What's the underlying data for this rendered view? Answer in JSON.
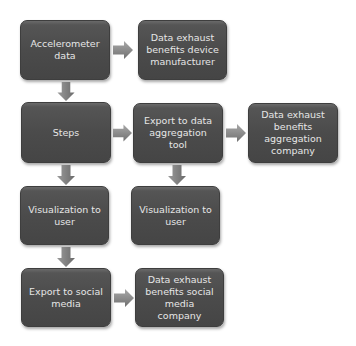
{
  "diagram": {
    "type": "flowchart",
    "nodes": [
      {
        "id": "accelerometer",
        "label": "Accelerometer data"
      },
      {
        "id": "exhaust_device",
        "label": "Data exhaust benefits device manufacturer"
      },
      {
        "id": "steps",
        "label": "Steps"
      },
      {
        "id": "export_aggregation",
        "label": "Export to data aggregation tool"
      },
      {
        "id": "exhaust_aggregation",
        "label": "Data exhaust benefits aggregation company"
      },
      {
        "id": "visualization_1",
        "label": "Visualization to user"
      },
      {
        "id": "visualization_2",
        "label": "Visualization to user"
      },
      {
        "id": "export_social",
        "label": "Export to social media"
      },
      {
        "id": "exhaust_social",
        "label": "Data exhaust benefits social media company"
      }
    ],
    "edges": [
      {
        "from": "accelerometer",
        "to": "exhaust_device",
        "direction": "right"
      },
      {
        "from": "accelerometer",
        "to": "steps",
        "direction": "down"
      },
      {
        "from": "steps",
        "to": "export_aggregation",
        "direction": "right"
      },
      {
        "from": "export_aggregation",
        "to": "exhaust_aggregation",
        "direction": "right"
      },
      {
        "from": "steps",
        "to": "visualization_1",
        "direction": "down"
      },
      {
        "from": "export_aggregation",
        "to": "visualization_2",
        "direction": "down"
      },
      {
        "from": "visualization_1",
        "to": "export_social",
        "direction": "down"
      },
      {
        "from": "export_social",
        "to": "exhaust_social",
        "direction": "right"
      }
    ],
    "colors": {
      "box_fill": "#4b4b4b",
      "box_text": "#e6e6e6",
      "arrow_fill": "#8a8a8a",
      "background": "#ffffff"
    }
  }
}
